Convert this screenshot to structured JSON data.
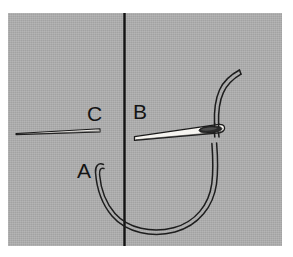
{
  "figure": {
    "kind": "sewing-instruction-diagram",
    "background_color": "#adadad",
    "border_color": "#ffffff",
    "ink_color": "#141414",
    "needle_fill_color": "#f2f0ec",
    "panel": {
      "x": 8,
      "y": 13,
      "width": 274,
      "height": 233
    }
  },
  "labels": {
    "a": "A",
    "b": "B",
    "c": "C"
  },
  "elements": {
    "fold_line_name": "fold-line",
    "threaded_needle_name": "threaded-needle",
    "bare_needle_name": "bare-needle",
    "thread_loop_name": "thread-loop",
    "thread_tail_name": "thread-tail"
  }
}
